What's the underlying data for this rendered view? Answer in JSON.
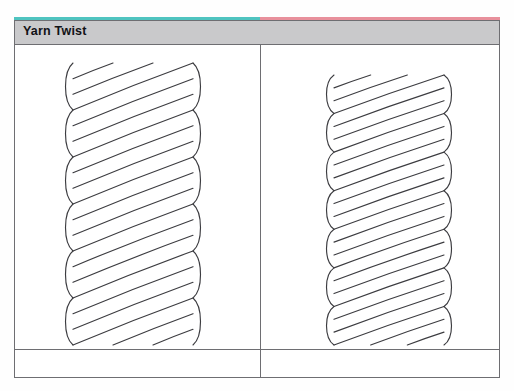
{
  "figure": {
    "header": {
      "title": "Yarn Twist"
    },
    "top_rule": {
      "left_color": "#4fc4c0",
      "right_color": "#e8909c"
    },
    "colors": {
      "header_band": "#c9c9cb",
      "border": "#6e6e72",
      "stroke": "#3c3c40",
      "background": "#ffffff"
    },
    "panels": [
      {
        "id": "left-panel",
        "name": "s-twist-yarn",
        "caption": "",
        "diagram": {
          "type": "rope-twist",
          "twist_direction": "S",
          "strand_count": 3,
          "turns": 6,
          "rope_width": 120,
          "rope_top": 18,
          "rope_bottom": 300,
          "center_x": 118
        }
      },
      {
        "id": "right-panel",
        "name": "z-twist-yarn",
        "caption": "",
        "diagram": {
          "type": "rope-twist",
          "twist_direction": "S",
          "strand_count": 3,
          "turns": 7,
          "rope_width": 110,
          "rope_top": 30,
          "rope_bottom": 300,
          "center_x": 128
        }
      }
    ]
  }
}
